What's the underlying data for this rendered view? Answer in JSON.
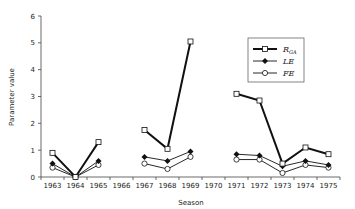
{
  "chart_data": {
    "type": "line",
    "title": "",
    "xlabel": "Season",
    "ylabel": "Parameter value",
    "ylim": [
      0,
      6
    ],
    "yticks": [
      0,
      1,
      2,
      3,
      4,
      5,
      6
    ],
    "categories": [
      "1963",
      "1964",
      "1965",
      "1966",
      "1967",
      "1968",
      "1969",
      "1970",
      "1971",
      "1972",
      "1973",
      "1974",
      "1975"
    ],
    "grid": false,
    "legend_position": "upper right",
    "series": [
      {
        "name": "R_GA",
        "label_main": "R",
        "label_sub": "GA",
        "marker": "open-square",
        "line": "thick-solid",
        "values": [
          0.9,
          0.0,
          1.3,
          null,
          1.75,
          1.05,
          5.05,
          null,
          3.1,
          2.85,
          0.5,
          1.1,
          0.85
        ]
      },
      {
        "name": "LE",
        "label_main": "LE",
        "label_sub": "",
        "marker": "filled-diamond",
        "line": "thin-solid",
        "values": [
          0.5,
          0.0,
          0.6,
          null,
          0.75,
          0.6,
          0.95,
          null,
          0.85,
          0.8,
          0.4,
          0.6,
          0.45
        ]
      },
      {
        "name": "FE",
        "label_main": "FE",
        "label_sub": "",
        "marker": "open-circle",
        "line": "thin-solid",
        "values": [
          0.35,
          0.0,
          0.45,
          null,
          0.5,
          0.3,
          0.75,
          null,
          0.65,
          0.65,
          0.15,
          0.45,
          0.35
        ]
      }
    ]
  },
  "colors": {
    "line": "#111111",
    "axis": "#444444",
    "marker_fill_open": "#ffffff"
  }
}
